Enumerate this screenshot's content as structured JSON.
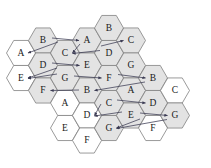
{
  "figure": {
    "type": "hexagonal-grid-diagram",
    "width": 211,
    "height": 168,
    "background_color": "#ffffff",
    "hex_fill_shaded": "#e3e3e3",
    "hex_fill_plain": "#ffffff",
    "hex_stroke": "#808080",
    "arrow_color": "#3a3a52",
    "label_color": "#1a1a1a"
  },
  "geometry": {
    "hex_radius": 14.5,
    "col_step": 21.8,
    "row_step": 25.1,
    "orientation": "pointy-left-right-flat-top-bottom"
  },
  "hexes": [
    {
      "id": "h0",
      "label": "A",
      "cx": 21.0,
      "cy": 53.0,
      "shaded": false
    },
    {
      "id": "h1",
      "label": "E",
      "cx": 21.0,
      "cy": 78.0,
      "shaded": false
    },
    {
      "id": "h2",
      "label": "B",
      "cx": 43.0,
      "cy": 40.5,
      "shaded": true
    },
    {
      "id": "h3",
      "label": "D",
      "cx": 43.0,
      "cy": 65.5,
      "shaded": true
    },
    {
      "id": "h4",
      "label": "F",
      "cx": 43.0,
      "cy": 90.5,
      "shaded": true
    },
    {
      "id": "h5",
      "label": "C",
      "cx": 65.0,
      "cy": 53.0,
      "shaded": true
    },
    {
      "id": "h6",
      "label": "G",
      "cx": 65.0,
      "cy": 78.0,
      "shaded": true
    },
    {
      "id": "h7",
      "label": "A",
      "cx": 65.0,
      "cy": 103.0,
      "shaded": false
    },
    {
      "id": "h8",
      "label": "E",
      "cx": 65.0,
      "cy": 128.0,
      "shaded": false
    },
    {
      "id": "h9",
      "label": "A",
      "cx": 87.0,
      "cy": 40.5,
      "shaded": true
    },
    {
      "id": "h10",
      "label": "E",
      "cx": 87.0,
      "cy": 65.5,
      "shaded": true
    },
    {
      "id": "h11",
      "label": "B",
      "cx": 87.0,
      "cy": 90.5,
      "shaded": true
    },
    {
      "id": "h12",
      "label": "D",
      "cx": 87.0,
      "cy": 115.5,
      "shaded": false
    },
    {
      "id": "h13",
      "label": "F",
      "cx": 87.0,
      "cy": 140.5,
      "shaded": false
    },
    {
      "id": "h14",
      "label": "B",
      "cx": 109.0,
      "cy": 28.0,
      "shaded": true
    },
    {
      "id": "h15",
      "label": "D",
      "cx": 109.0,
      "cy": 53.0,
      "shaded": true
    },
    {
      "id": "h16",
      "label": "F",
      "cx": 109.0,
      "cy": 78.0,
      "shaded": true
    },
    {
      "id": "h17",
      "label": "C",
      "cx": 109.0,
      "cy": 103.0,
      "shaded": true
    },
    {
      "id": "h18",
      "label": "G",
      "cx": 109.0,
      "cy": 128.0,
      "shaded": true
    },
    {
      "id": "h19",
      "label": "C",
      "cx": 131.0,
      "cy": 40.5,
      "shaded": true
    },
    {
      "id": "h20",
      "label": "G",
      "cx": 131.0,
      "cy": 65.5,
      "shaded": true
    },
    {
      "id": "h21",
      "label": "A",
      "cx": 131.0,
      "cy": 90.5,
      "shaded": true
    },
    {
      "id": "h22",
      "label": "E",
      "cx": 131.0,
      "cy": 115.5,
      "shaded": true
    },
    {
      "id": "h23",
      "label": "B",
      "cx": 153.0,
      "cy": 78.0,
      "shaded": true
    },
    {
      "id": "h24",
      "label": "D",
      "cx": 153.0,
      "cy": 103.0,
      "shaded": true
    },
    {
      "id": "h25",
      "label": "F",
      "cx": 153.0,
      "cy": 128.0,
      "shaded": false
    },
    {
      "id": "h26",
      "label": "C",
      "cx": 175.0,
      "cy": 90.5,
      "shaded": false
    },
    {
      "id": "h27",
      "label": "G",
      "cx": 175.0,
      "cy": 115.5,
      "shaded": true
    }
  ],
  "arrows": [
    {
      "id": "a1",
      "from": "h2",
      "to": "h0",
      "x1": 58.0,
      "y1": 42.0,
      "x2": 28.0,
      "y2": 53.0
    },
    {
      "id": "a2",
      "from": "h2",
      "to": "h9",
      "x1": 52.0,
      "y1": 38.0,
      "x2": 79.0,
      "y2": 40.5
    },
    {
      "id": "a3",
      "from": "h9",
      "to": "h5",
      "x1": 80.0,
      "y1": 44.0,
      "x2": 72.5,
      "y2": 53.0
    },
    {
      "id": "a4",
      "from": "h15",
      "to": "h5",
      "x1": 100.0,
      "y1": 50.5,
      "x2": 72.5,
      "y2": 53.5
    },
    {
      "id": "a5",
      "from": "h15",
      "to": "h19",
      "x1": 101.0,
      "y1": 46.0,
      "x2": 123.5,
      "y2": 40.5
    },
    {
      "id": "a6",
      "from": "h3",
      "to": "h10",
      "x1": 52.0,
      "y1": 63.0,
      "x2": 79.5,
      "y2": 65.5
    },
    {
      "id": "a7",
      "from": "h3",
      "to": "h1",
      "x1": 57.0,
      "y1": 68.0,
      "x2": 28.0,
      "y2": 78.0
    },
    {
      "id": "a8",
      "from": "h6",
      "to": "h1",
      "x1": 57.0,
      "y1": 74.0,
      "x2": 28.0,
      "y2": 78.5
    },
    {
      "id": "a9",
      "from": "h6",
      "to": "h16",
      "x1": 74.0,
      "y1": 76.0,
      "x2": 101.5,
      "y2": 78.0
    },
    {
      "id": "a10",
      "from": "h16",
      "to": "h23",
      "x1": 118.0,
      "y1": 74.5,
      "x2": 145.5,
      "y2": 78.0
    },
    {
      "id": "a11",
      "from": "h11",
      "to": "h4",
      "x1": 79.0,
      "y1": 90.0,
      "x2": 50.5,
      "y2": 90.5
    },
    {
      "id": "a12",
      "from": "h23",
      "to": "h11",
      "x1": 145.0,
      "y1": 82.0,
      "x2": 94.5,
      "y2": 90.5
    },
    {
      "id": "a13",
      "from": "h17",
      "to": "h24",
      "x1": 117.0,
      "y1": 100.0,
      "x2": 145.5,
      "y2": 103.0
    },
    {
      "id": "a14",
      "from": "h17",
      "to": "h12",
      "x1": 101.0,
      "y1": 104.0,
      "x2": 94.5,
      "y2": 115.5
    },
    {
      "id": "a15",
      "from": "h22",
      "to": "h12",
      "x1": 122.0,
      "y1": 112.0,
      "x2": 94.5,
      "y2": 116.0
    },
    {
      "id": "a16",
      "from": "h22",
      "to": "h27",
      "x1": 140.0,
      "y1": 113.0,
      "x2": 167.5,
      "y2": 115.5
    },
    {
      "id": "a17",
      "from": "h22",
      "to": "h18",
      "x1": 140.0,
      "y1": 119.0,
      "x2": 116.5,
      "y2": 128.0
    },
    {
      "id": "a18",
      "from": "h27",
      "to": "h18",
      "x1": 167.0,
      "y1": 119.5,
      "x2": 116.5,
      "y2": 128.5
    }
  ]
}
